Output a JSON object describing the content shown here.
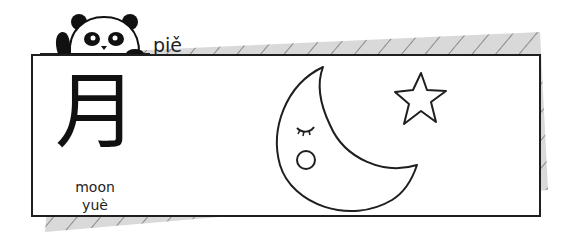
{
  "header": {
    "title_word": "piě",
    "mascot": "panda-icon"
  },
  "card": {
    "character": "月",
    "meaning": "moon",
    "pinyin": "yuè",
    "illustration": {
      "moon": "crescent-moon-icon",
      "star": "star-icon"
    }
  },
  "colors": {
    "outline": "#1f1f1f",
    "shadow_fill": "#d9d9d9",
    "hatch": "#8a8a8a",
    "cheek": "#ffffff"
  }
}
